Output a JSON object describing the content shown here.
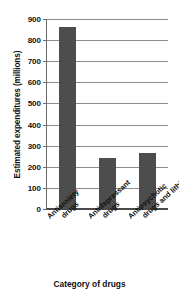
{
  "chart_data": {
    "type": "bar",
    "title": "",
    "xlabel": "Category of drugs",
    "ylabel": "Estimated expenditures (millions)",
    "categories": [
      "Antianxiety drugs",
      "Antidepressant drugs",
      "Antipsychotic drugs and lithium"
    ],
    "category_lines": [
      [
        "Antianxiety",
        "drugs"
      ],
      [
        "Antidepressant",
        "drugs"
      ],
      [
        "Antipsychotic",
        "drugs and lithium"
      ]
    ],
    "values": [
      860,
      240,
      265
    ],
    "ylim": [
      0,
      900
    ],
    "ytick_step": 100,
    "yticks": [
      900,
      800,
      700,
      600,
      500,
      400,
      300,
      200,
      100,
      0
    ],
    "grid": true,
    "legend": null,
    "colors": {
      "bar": "#4d4d4d",
      "gridline": "#8c8c8c",
      "axis": "#4a4a4a",
      "text": "#111111",
      "background": "#ffffff"
    }
  }
}
